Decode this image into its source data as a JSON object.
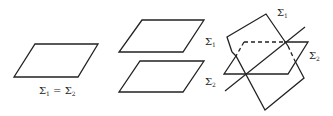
{
  "diagram": {
    "stroke_color": "#222222",
    "background": "#ffffff",
    "panels": [
      {
        "case": "coincident",
        "label": {
          "sym1": "Σ",
          "sub1": "1",
          "eq": " = ",
          "sym2": "Σ",
          "sub2": "2"
        }
      },
      {
        "case": "parallel",
        "label_top": {
          "sym": "Σ",
          "sub": "1"
        },
        "label_bottom": {
          "sym": "Σ",
          "sub": "2"
        }
      },
      {
        "case": "intersecting",
        "label_tilted": {
          "sym": "Σ",
          "sub": "1"
        },
        "label_horizontal": {
          "sym": "Σ",
          "sub": "2"
        }
      }
    ]
  }
}
